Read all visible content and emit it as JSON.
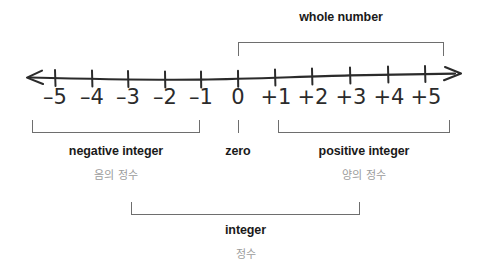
{
  "diagram": {
    "line_color": "#2b2b2b",
    "bracket_color": "#6e6e6e",
    "label_color": "#1a1a1a",
    "korean_label_color": "#9b9b9b"
  },
  "number_line": {
    "arrow_left_icon": "left-arrow-icon",
    "arrow_right_icon": "right-arrow-icon",
    "ticks": [
      {
        "label": "–5",
        "value": -5,
        "x": 55
      },
      {
        "label": "–4",
        "value": -4,
        "x": 92
      },
      {
        "label": "–3",
        "value": -3,
        "x": 128
      },
      {
        "label": "–2",
        "value": -2,
        "x": 165
      },
      {
        "label": "–1",
        "value": -1,
        "x": 201
      },
      {
        "label": "0",
        "value": 0,
        "x": 238
      },
      {
        "label": "+1",
        "value": 1,
        "x": 275
      },
      {
        "label": "+2",
        "value": 2,
        "x": 312
      },
      {
        "label": "+3",
        "value": 3,
        "x": 350
      },
      {
        "label": "+4",
        "value": 4,
        "x": 388
      },
      {
        "label": "+5",
        "value": 5,
        "x": 425
      }
    ]
  },
  "groups": {
    "whole_number": {
      "label": "whole number",
      "range": [
        0,
        5
      ],
      "bracket_x": 238,
      "bracket_width": 206
    },
    "negative_integer": {
      "label": "negative integer",
      "label_ko": "음의 정수",
      "range": [
        -5,
        -1
      ],
      "bracket_x": 32,
      "bracket_width": 168
    },
    "zero": {
      "label": "zero",
      "label_ko": "",
      "range": [
        0,
        0
      ],
      "bracket_x": 238,
      "bracket_width": 0
    },
    "positive_integer": {
      "label": "positive integer",
      "label_ko": "양의 정수",
      "range": [
        1,
        5
      ],
      "bracket_x": 278,
      "bracket_width": 172
    },
    "integer": {
      "label": "integer",
      "label_ko": "정수",
      "range": [
        -5,
        5
      ],
      "bracket_x": 131,
      "bracket_width": 229
    }
  }
}
